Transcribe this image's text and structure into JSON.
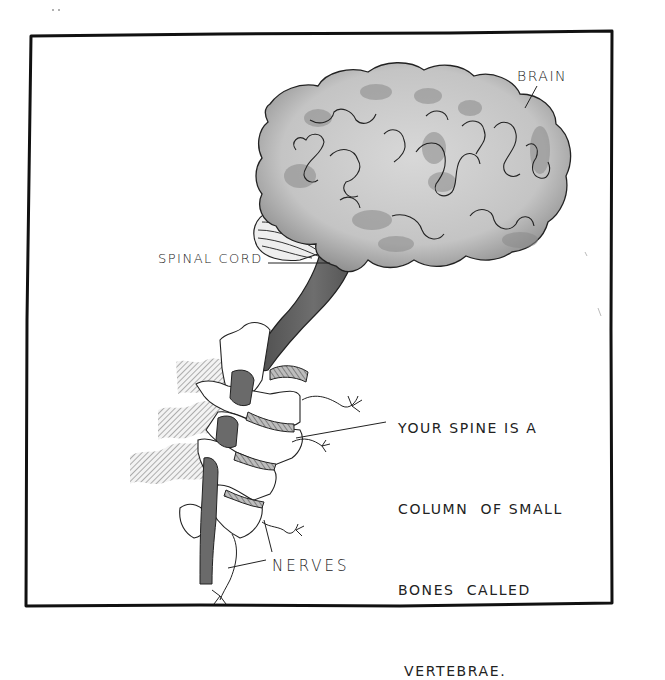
{
  "figure": {
    "style": "hand-drawn pencil illustration",
    "frame_color": "#111111",
    "background": "#ffffff",
    "brain_fill": "#c9c9c9",
    "brain_shadow": "#8a8a8a",
    "cord_fill": "#5e5e5e"
  },
  "labels": {
    "brain": "BRAIN",
    "spinal_cord": "SPINAL CORD",
    "nerves": "NERVES"
  },
  "caption": {
    "lines": [
      "YOUR SPINE IS A",
      "COLUMN  OF SMALL",
      "BONES  CALLED",
      " VERTEBRAE."
    ]
  }
}
